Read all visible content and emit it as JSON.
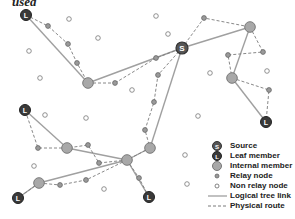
{
  "caption": "used",
  "colors": {
    "tree_link": "#a0a0a0",
    "physical_route": "#7a7a7a",
    "leaf_fill": "#3a3a3a",
    "source_fill": "#555555",
    "internal_fill": "#a8a8a8",
    "relay_fill": "#9a9a9a",
    "non_relay_fill": "#ffffff"
  },
  "legend": {
    "items": [
      {
        "label": "Source",
        "type": "source"
      },
      {
        "label": "Leaf member",
        "type": "leaf"
      },
      {
        "label": "Internal member",
        "type": "internal"
      },
      {
        "label": "Relay node",
        "type": "relay"
      },
      {
        "label": "Non relay node",
        "type": "nonrelay"
      },
      {
        "label": "Logical tree link",
        "type": "tree"
      },
      {
        "label": "Physical route",
        "type": "route"
      }
    ]
  },
  "nodes": {
    "source": {
      "x": 182,
      "y": 48,
      "glyph": "S"
    },
    "leaves": [
      {
        "x": 26,
        "y": 15,
        "glyph": "L"
      },
      {
        "x": 25,
        "y": 110,
        "glyph": "L"
      },
      {
        "x": 18,
        "y": 198,
        "glyph": "L"
      },
      {
        "x": 149,
        "y": 197,
        "glyph": "L"
      },
      {
        "x": 266,
        "y": 122,
        "glyph": "L"
      }
    ],
    "internal": [
      {
        "x": 88,
        "y": 83
      },
      {
        "x": 250,
        "y": 27
      },
      {
        "x": 232,
        "y": 78
      },
      {
        "x": 67,
        "y": 148
      },
      {
        "x": 127,
        "y": 160
      },
      {
        "x": 150,
        "y": 148
      },
      {
        "x": 39,
        "y": 183
      }
    ],
    "relay": [
      {
        "x": 48,
        "y": 26
      },
      {
        "x": 68,
        "y": 44
      },
      {
        "x": 77,
        "y": 63
      },
      {
        "x": 115,
        "y": 83
      },
      {
        "x": 204,
        "y": 18
      },
      {
        "x": 156,
        "y": 58
      },
      {
        "x": 228,
        "y": 55
      },
      {
        "x": 263,
        "y": 52
      },
      {
        "x": 269,
        "y": 90
      },
      {
        "x": 158,
        "y": 75
      },
      {
        "x": 154,
        "y": 102
      },
      {
        "x": 145,
        "y": 130
      },
      {
        "x": 38,
        "y": 148
      },
      {
        "x": 88,
        "y": 145
      },
      {
        "x": 99,
        "y": 163
      },
      {
        "x": 139,
        "y": 178
      },
      {
        "x": 60,
        "y": 185
      },
      {
        "x": 86,
        "y": 180
      }
    ],
    "non_relay": [
      {
        "x": 69,
        "y": 19
      },
      {
        "x": 98,
        "y": 38
      },
      {
        "x": 29,
        "y": 51
      },
      {
        "x": 40,
        "y": 78
      },
      {
        "x": 132,
        "y": 90
      },
      {
        "x": 45,
        "y": 115
      },
      {
        "x": 86,
        "y": 118
      },
      {
        "x": 34,
        "y": 166
      },
      {
        "x": 104,
        "y": 189
      },
      {
        "x": 156,
        "y": 16
      },
      {
        "x": 168,
        "y": 34
      },
      {
        "x": 210,
        "y": 73
      },
      {
        "x": 267,
        "y": 71
      },
      {
        "x": 185,
        "y": 155
      },
      {
        "x": 187,
        "y": 184
      },
      {
        "x": 198,
        "y": 116
      }
    ]
  },
  "tree_links": [
    [
      26,
      15,
      88,
      83
    ],
    [
      88,
      83,
      182,
      48
    ],
    [
      182,
      48,
      250,
      27
    ],
    [
      250,
      27,
      232,
      78
    ],
    [
      232,
      78,
      266,
      122
    ],
    [
      182,
      48,
      150,
      148
    ],
    [
      150,
      148,
      127,
      160
    ],
    [
      127,
      160,
      149,
      197
    ],
    [
      127,
      160,
      67,
      148
    ],
    [
      127,
      160,
      39,
      183
    ],
    [
      67,
      148,
      25,
      110
    ],
    [
      39,
      183,
      18,
      198
    ]
  ],
  "routes": [
    [
      [
        26,
        15
      ],
      [
        48,
        26
      ],
      [
        68,
        44
      ],
      [
        77,
        63
      ],
      [
        88,
        83
      ]
    ],
    [
      [
        88,
        83
      ],
      [
        115,
        83
      ]
    ],
    [
      [
        115,
        83
      ],
      [
        156,
        58
      ],
      [
        182,
        48
      ]
    ],
    [
      [
        182,
        48
      ],
      [
        204,
        18
      ],
      [
        250,
        27
      ]
    ],
    [
      [
        250,
        27
      ],
      [
        263,
        52
      ],
      [
        228,
        55
      ],
      [
        232,
        78
      ]
    ],
    [
      [
        232,
        78
      ],
      [
        269,
        90
      ],
      [
        266,
        122
      ]
    ],
    [
      [
        182,
        48
      ],
      [
        158,
        75
      ],
      [
        154,
        102
      ],
      [
        145,
        130
      ],
      [
        150,
        148
      ]
    ],
    [
      [
        150,
        148
      ],
      [
        127,
        160
      ]
    ],
    [
      [
        127,
        160
      ],
      [
        139,
        178
      ],
      [
        149,
        197
      ]
    ],
    [
      [
        127,
        160
      ],
      [
        99,
        163
      ],
      [
        88,
        145
      ],
      [
        67,
        148
      ]
    ],
    [
      [
        67,
        148
      ],
      [
        38,
        148
      ],
      [
        25,
        110
      ]
    ],
    [
      [
        127,
        160
      ],
      [
        86,
        180
      ],
      [
        60,
        185
      ],
      [
        39,
        183
      ]
    ],
    [
      [
        39,
        183
      ],
      [
        18,
        198
      ]
    ]
  ]
}
